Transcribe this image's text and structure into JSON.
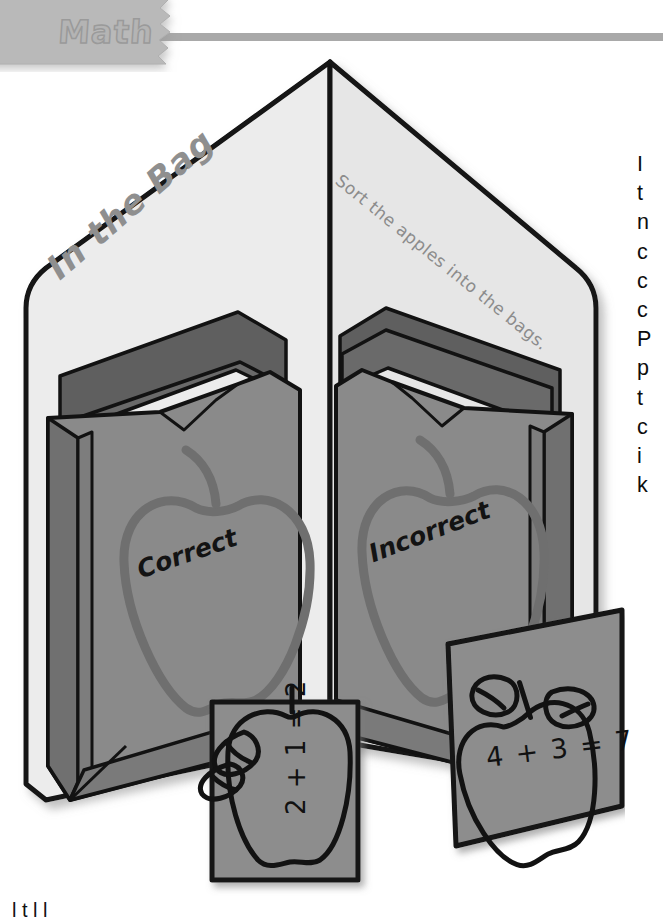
{
  "banner": {
    "subject_label": "Math",
    "badge_color": "#b9b9b9",
    "rule_color": "#a9a9a9"
  },
  "activity": {
    "title": "In the Bag",
    "instruction": "Sort the apples into the bags.",
    "bags": [
      {
        "label": "Correct",
        "apple_outline_color": "#6f6f6f"
      },
      {
        "label": "Incorrect",
        "apple_outline_color": "#6f6f6f"
      }
    ],
    "cards": [
      {
        "equation": "2 + 1 = 2",
        "name": "apple-card-left"
      },
      {
        "equation": "4 + 3 = 7",
        "name": "apple-card-right"
      }
    ]
  },
  "colors": {
    "folder_face": "#ececec",
    "folder_face_shadow": "#e2e2e2",
    "bag_front": "#8a8a8a",
    "bag_side": "#6e6e6e",
    "bag_inner": "#636363",
    "card_fill": "#8d8d8d",
    "outline": "#121212",
    "page_background": "#ffffff"
  },
  "body_column": {
    "lines": [
      "I",
      "t",
      "n",
      "c",
      "c",
      "c",
      "P",
      "p",
      "t",
      "c",
      "i",
      "k"
    ]
  },
  "footer": {
    "clipped_text": "l              t l   l"
  }
}
